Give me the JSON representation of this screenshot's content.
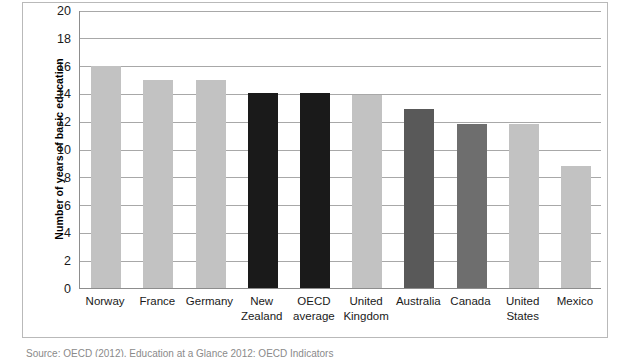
{
  "chart_data": {
    "type": "bar",
    "title": "",
    "xlabel": "",
    "ylabel": "Number of years of basic education",
    "categories": [
      "Norway",
      "France",
      "Germany",
      "New Zealand",
      "OECD average",
      "United Kingdom",
      "Australia",
      "Canada",
      "United States",
      "Mexico"
    ],
    "values": [
      16,
      15,
      15,
      14,
      14,
      13.9,
      12.9,
      11.8,
      11.8,
      8.8
    ],
    "bar_colors": [
      "#c2c2c2",
      "#c2c2c2",
      "#c2c2c2",
      "#1a1a1a",
      "#1a1a1a",
      "#c2c2c2",
      "#595959",
      "#6e6e6e",
      "#c2c2c2",
      "#c2c2c2"
    ],
    "ylim": [
      0,
      20
    ],
    "yticks": [
      0,
      2,
      4,
      6,
      8,
      10,
      12,
      14,
      16,
      18,
      20
    ],
    "ytick_labels": [
      "0",
      "2",
      "4",
      "6",
      "8",
      "10",
      "12",
      "14",
      "16",
      "18",
      "20"
    ],
    "grid": true,
    "legend": "none",
    "gridline_color": "#a8a8a8",
    "axis_color": "#8d8d8d",
    "plot_background": "#ffffff"
  },
  "caption": {
    "text": "Source: OECD (2012), Education at a Glance 2012: OECD Indicators"
  }
}
